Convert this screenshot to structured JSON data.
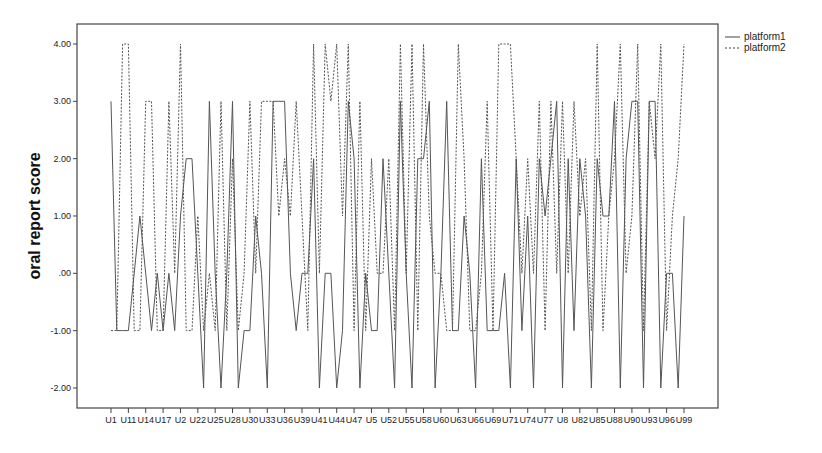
{
  "chart_data": {
    "type": "line",
    "title": "",
    "xlabel": "",
    "ylabel": "oral report score",
    "ylim": [
      -2.35,
      4.35
    ],
    "y_ticks": [
      4.0,
      3.0,
      2.0,
      1.0,
      0.0,
      -1.0,
      -2.0
    ],
    "y_tick_labels": [
      "4.00",
      "3.00",
      "2.00",
      "1.00",
      ".00",
      "-1.00",
      "-2.00"
    ],
    "x_tick_labels": [
      "U1",
      "U11",
      "U14",
      "U17",
      "U2",
      "U22",
      "U25",
      "U28",
      "U30",
      "U33",
      "U36",
      "U39",
      "U41",
      "U44",
      "U47",
      "U5",
      "U52",
      "U55",
      "U58",
      "U60",
      "U63",
      "U66",
      "U69",
      "U71",
      "U74",
      "U77",
      "U8",
      "U82",
      "U85",
      "U88",
      "U90",
      "U93",
      "U96",
      "U99"
    ],
    "grid": false,
    "legend_position": "top-right outside",
    "series": [
      {
        "name": "platform1",
        "style": "solid",
        "values": [
          3,
          -1,
          -1,
          -1,
          0,
          1,
          0,
          -1,
          0,
          -1,
          0,
          -1,
          1,
          2,
          2,
          0,
          -2,
          3,
          0,
          -2,
          0,
          3,
          -2,
          -1,
          -1,
          1,
          0,
          -2,
          3,
          3,
          3,
          0,
          -1,
          0,
          0,
          2,
          -2,
          0,
          0,
          -2,
          -1,
          3,
          2,
          -2,
          0,
          -1,
          -1,
          2,
          0,
          -2,
          3,
          0,
          -2,
          2,
          2,
          3,
          -2,
          0,
          3,
          -1,
          -1,
          1,
          0,
          -2,
          2,
          -1,
          -1,
          -1,
          0,
          -2,
          2,
          -1,
          1,
          -2,
          2,
          1,
          2,
          3,
          -2,
          2,
          -1,
          2,
          1,
          -2,
          2,
          1,
          1,
          3,
          -2,
          2,
          3,
          3,
          -2,
          3,
          3,
          -2,
          0,
          0,
          -2,
          1
        ]
      },
      {
        "name": "platform2",
        "style": "dashed",
        "values": [
          -1,
          -1,
          4,
          4,
          -1,
          -1,
          3,
          3,
          -1,
          -1,
          3,
          0,
          4,
          -1,
          -1,
          1,
          -1,
          0,
          -1,
          3,
          -1,
          2,
          -1,
          0,
          3,
          0,
          3,
          3,
          3,
          1,
          2,
          1,
          3,
          1,
          -1,
          4,
          0,
          4,
          3,
          4,
          1,
          4,
          -1,
          3,
          -1,
          2,
          0,
          0,
          2,
          -1,
          4,
          0,
          4,
          -1,
          4,
          1,
          0,
          0,
          -1,
          -1,
          4,
          2,
          -1,
          -1,
          0,
          3,
          -1,
          4,
          4,
          4,
          2,
          0,
          2,
          0,
          3,
          -1,
          3,
          0,
          3,
          0,
          3,
          1,
          2,
          -1,
          4,
          -1,
          1,
          2,
          4,
          0,
          1,
          4,
          -1,
          3,
          2,
          4,
          -1,
          1,
          2,
          4
        ]
      }
    ]
  },
  "legend": {
    "items": [
      {
        "label": "platform1",
        "style": "solid"
      },
      {
        "label": "platform2",
        "style": "dashed"
      }
    ]
  },
  "colors": {
    "line": "#555555",
    "axis": "#333333",
    "background": "#ffffff"
  }
}
